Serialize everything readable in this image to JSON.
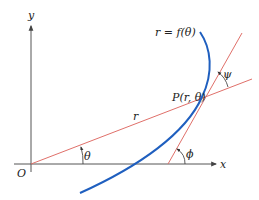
{
  "diagram": {
    "type": "polar-curve-tangent-angle",
    "colors": {
      "axes": "#555555",
      "curve": "#1f5fbf",
      "lines": "#e0706a",
      "text": "#222222"
    },
    "labels": {
      "y_axis": "y",
      "x_axis": "x",
      "origin": "O",
      "curve": "r = f(θ)",
      "point": "P(r, θ)",
      "radius": "r",
      "theta": "θ",
      "phi": "ϕ",
      "psi": "ψ"
    }
  }
}
